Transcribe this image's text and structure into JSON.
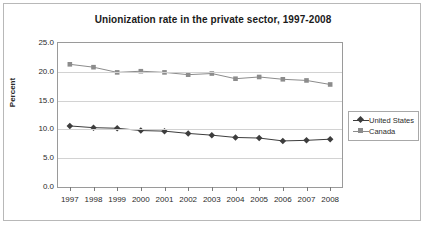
{
  "chart_data": {
    "type": "line",
    "title": "Unionization rate in the private sector, 1997-2008",
    "xlabel": "",
    "ylabel": "Percent",
    "categories": [
      "1997",
      "1998",
      "1999",
      "2000",
      "2001",
      "2002",
      "2003",
      "2004",
      "2005",
      "2006",
      "2007",
      "2008"
    ],
    "ylim": [
      0.0,
      25.0
    ],
    "yticks": [
      "0.0",
      "5.0",
      "10.0",
      "15.0",
      "20.0",
      "25.0"
    ],
    "ytick_values": [
      0.0,
      5.0,
      10.0,
      15.0,
      20.0,
      25.0
    ],
    "grid": "horizontal",
    "legend_position": "right",
    "series": [
      {
        "name": "United States",
        "color": "#3d3d3d",
        "marker": "diamond",
        "values": [
          10.6,
          10.3,
          10.2,
          9.8,
          9.7,
          9.3,
          9.0,
          8.6,
          8.5,
          8.0,
          8.1,
          8.3
        ]
      },
      {
        "name": "Canada",
        "color": "#8c8c8c",
        "marker": "square",
        "values": [
          21.3,
          20.8,
          19.9,
          20.1,
          19.9,
          19.5,
          19.7,
          18.8,
          19.1,
          18.7,
          18.5,
          17.8
        ]
      }
    ]
  },
  "legend": {
    "items": [
      {
        "label": "United States"
      },
      {
        "label": "Canada"
      }
    ]
  },
  "colors": {
    "frame_border": "#b8b8b8",
    "plot_border": "#9a9a9a",
    "gridline": "#d2d2d2",
    "text": "#2b2b2b",
    "series_us": "#3d3d3d",
    "series_canada": "#8c8c8c"
  }
}
